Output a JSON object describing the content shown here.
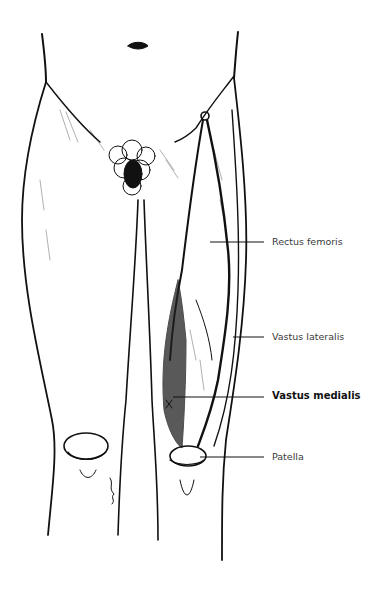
{
  "figure": {
    "colors": {
      "ink": "#111111",
      "background": "#ffffff",
      "label_text": "#3a3a3a"
    }
  },
  "labels": [
    {
      "id": "rectus-femoris",
      "text": "Rectus femoris",
      "bold": false,
      "x": 272,
      "y": 236,
      "line": {
        "x1": 210,
        "y1": 242,
        "x2": 264,
        "y2": 242
      }
    },
    {
      "id": "vastus-lateralis",
      "text": "Vastus lateralis",
      "bold": false,
      "x": 272,
      "y": 332,
      "line": {
        "x1": 233,
        "y1": 337,
        "x2": 264,
        "y2": 337
      }
    },
    {
      "id": "vastus-medialis",
      "text": "Vastus medialis",
      "bold": true,
      "x": 272,
      "y": 390,
      "line": {
        "x1": 173,
        "y1": 397,
        "x2": 264,
        "y2": 397
      }
    },
    {
      "id": "patella",
      "text": "Patella",
      "bold": false,
      "x": 272,
      "y": 452,
      "line": {
        "x1": 200,
        "y1": 457,
        "x2": 264,
        "y2": 457
      }
    }
  ]
}
